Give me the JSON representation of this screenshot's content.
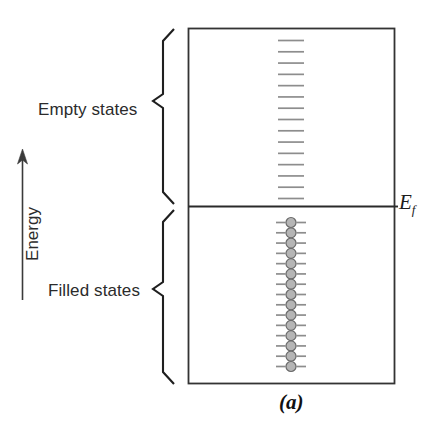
{
  "figure": {
    "caption": "(a)",
    "axis_label": "Energy",
    "fermi_label_base": "E",
    "fermi_label_sub": "f",
    "regions": [
      {
        "name": "empty-states",
        "label": "Empty states"
      },
      {
        "name": "filled-states",
        "label": "Filled states"
      }
    ]
  },
  "chart_data": {
    "type": "diagram",
    "title": "(a)",
    "subtitle": "Electron band structure: filled and empty states about the Fermi energy",
    "ylabel": "Energy",
    "xlabel": "",
    "grid": false,
    "legend": "none",
    "box": {
      "x": 188,
      "y": 28,
      "width": 206,
      "height": 355
    },
    "fermi_level": {
      "label": "E_f",
      "y": 206,
      "line_color": "#2a2a2a",
      "line_width": 1.8
    },
    "empty_states": {
      "label": "Empty states",
      "count": 15,
      "marker": "dash",
      "dash_color": "#8d8d8d",
      "dash_width": 26,
      "y_top": 40,
      "y_bottom": 198,
      "x_center": 291
    },
    "filled_states": {
      "label": "Filled states",
      "count": 15,
      "marker": "circle-on-dash",
      "circle_fill": "#b5b5b5",
      "circle_stroke": "#6a6a6a",
      "circle_radius": 5,
      "dash_color": "#8d8d8d",
      "dash_width": 30,
      "y_top": 222,
      "y_bottom": 366,
      "x_center": 291
    },
    "braces": [
      {
        "name": "empty-states-brace",
        "x": 160,
        "y_top": 28,
        "y_bottom": 204
      },
      {
        "name": "filled-states-brace",
        "x": 160,
        "y_top": 210,
        "y_bottom": 384
      }
    ],
    "energy_arrow": {
      "x": 22,
      "y_tail": 300,
      "y_head": 152,
      "direction": "up"
    },
    "colors": {
      "background": "#ffffff",
      "box_stroke": "#333333",
      "text": "#2b2b2b"
    }
  }
}
